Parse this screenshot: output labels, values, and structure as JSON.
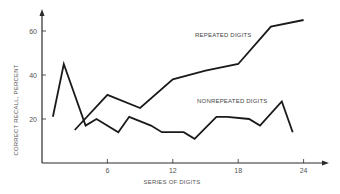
{
  "chart_data": {
    "type": "line",
    "title": "",
    "xlabel": "SERIES OF DIGITS",
    "ylabel": "CORRECT RECALL, PERCENT",
    "xlim": [
      0,
      25
    ],
    "ylim": [
      0,
      70
    ],
    "x_ticks": [
      6,
      12,
      18,
      24
    ],
    "y_ticks": [
      20,
      40,
      60
    ],
    "grid": false,
    "legend": "inline labels",
    "series": [
      {
        "name": "REPEATED DIGITS",
        "x": [
          3,
          6,
          9,
          12,
          15,
          18,
          21,
          24
        ],
        "values": [
          15,
          31,
          25,
          38,
          42,
          45,
          62,
          65
        ],
        "label_pos": [
          18,
          56
        ]
      },
      {
        "name": "NONREPEATED DIGITS",
        "x": [
          1,
          2,
          4,
          5,
          7,
          8,
          10,
          11,
          13,
          14,
          16,
          17,
          19,
          20,
          22,
          23
        ],
        "values": [
          21,
          45,
          17,
          20,
          14,
          21,
          17,
          14,
          14,
          11,
          21,
          21,
          20,
          17,
          28,
          14
        ],
        "label_pos": [
          15,
          27
        ]
      }
    ]
  },
  "labels": {
    "xlabel": "SERIES OF DIGITS",
    "ylabel": "CORRECT RECALL, PERCENT",
    "series_repeated": "REPEATED DIGITS",
    "series_nonrepeated": "NONREPEATED DIGITS"
  },
  "colors": {
    "line": "#1a1a1a",
    "axis": "#2a2a2a",
    "text": "#555555"
  }
}
